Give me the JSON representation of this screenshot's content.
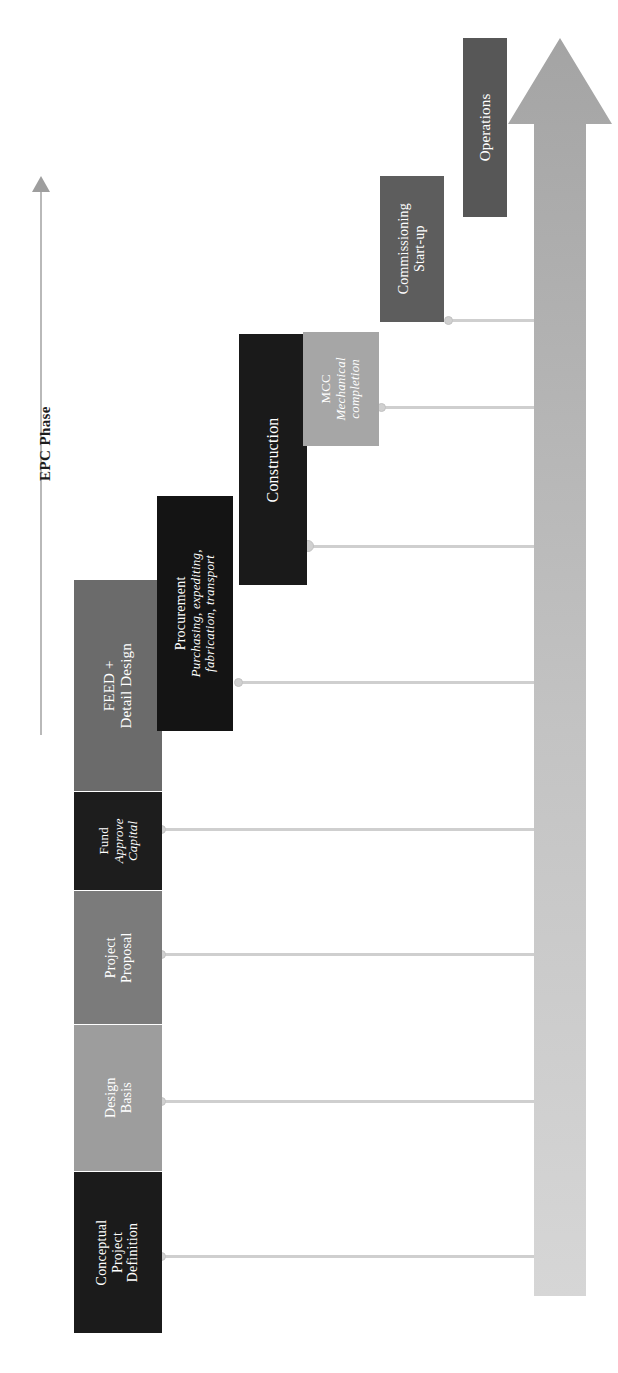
{
  "diagram": {
    "axis": {
      "label": "EPC Phase",
      "direction": "increasing-upward"
    },
    "big_arrow": {
      "name": "project-timeline-arrow",
      "direction": "up",
      "color_start": "#d9d9d9",
      "color_end": "#a8a8a8"
    },
    "colors": {
      "conceptual": "#1b1b1b",
      "design_basis": "#9d9d9d",
      "project_proposal": "#7b7b7b",
      "fund": "#1d1d1d",
      "feed": "#6b6b6b",
      "procurement": "#141414",
      "construction": "#1a1a1a",
      "mcc": "#a6a6a6",
      "commissioning": "#5d5d5d",
      "operations": "#575757",
      "connector": "#cfcfcf"
    },
    "steps": [
      {
        "id": "conceptual-project-definition",
        "lines": [
          "Conceptual",
          "Project",
          "Definition"
        ],
        "italic_lines": [],
        "fill": "#1b1b1b"
      },
      {
        "id": "design-basis",
        "lines": [
          "Design",
          "Basis"
        ],
        "italic_lines": [],
        "fill": "#9d9d9d"
      },
      {
        "id": "project-proposal",
        "lines": [
          "Project",
          "Proposal"
        ],
        "italic_lines": [],
        "fill": "#7b7b7b"
      },
      {
        "id": "fund-approve-capital",
        "lines": [
          "Fund",
          "Approve",
          "Capital"
        ],
        "italic_lines": [
          "Approve",
          "Capital"
        ],
        "fill": "#1d1d1d"
      },
      {
        "id": "feed-detail-design",
        "lines": [
          "FEED +",
          "Detail Design"
        ],
        "italic_lines": [],
        "fill": "#6b6b6b"
      },
      {
        "id": "procurement",
        "lines": [
          "Procurement",
          "Purchasing, expediting,",
          "fabrication, transport"
        ],
        "italic_lines": [
          "Purchasing, expediting,",
          "fabrication, transport"
        ],
        "fill": "#141414"
      },
      {
        "id": "construction",
        "lines": [
          "Construction"
        ],
        "italic_lines": [],
        "fill": "#1a1a1a"
      },
      {
        "id": "mcc-mechanical-completion",
        "lines": [
          "MCC",
          "Mechanical",
          "completion"
        ],
        "italic_lines": [
          "Mechanical",
          "completion"
        ],
        "fill": "#a6a6a6"
      },
      {
        "id": "commissioning-start-up",
        "lines": [
          "Commissioning",
          "Start-up"
        ],
        "italic_lines": [],
        "fill": "#5d5d5d"
      },
      {
        "id": "operations",
        "lines": [
          "Operations"
        ],
        "italic_lines": [],
        "fill": "#575757"
      }
    ]
  }
}
